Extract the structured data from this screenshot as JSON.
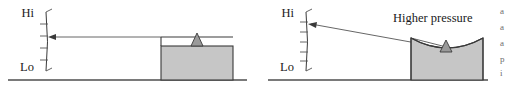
{
  "figure": {
    "panels": [
      {
        "id": "left-panel",
        "name": "low-pressure-panel",
        "gauge": {
          "name": "pressure-gauge-left",
          "high_label": "Hi",
          "low_label": "Lo",
          "tick_count": 5,
          "needle_reading_fraction": 0.5
        },
        "vessel": {
          "name": "vessel-left",
          "surface": "flat",
          "fill_color": "#c6c6c6",
          "outline_color": "#3a3a3a"
        },
        "callout": {
          "text": "",
          "visible": false
        }
      },
      {
        "id": "right-panel",
        "name": "high-pressure-panel",
        "gauge": {
          "name": "pressure-gauge-right",
          "high_label": "Hi",
          "low_label": "Lo",
          "tick_count": 6,
          "needle_reading_fraction": 0.78
        },
        "vessel": {
          "name": "vessel-right",
          "surface": "concave",
          "fill_color": "#c6c6c6",
          "outline_color": "#3a3a3a"
        },
        "callout": {
          "text": "Higher pressure",
          "visible": true
        }
      }
    ],
    "margin_text": {
      "name": "cropped-body-text",
      "lines": [
        "a",
        "a",
        "a",
        "p",
        "i"
      ]
    },
    "colors": {
      "vessel_fill": "#c6c6c6",
      "outline": "#3a3a3a",
      "ground": "#7a7a7a",
      "pointer": "#9a9a9a",
      "text": "#1b1b1b"
    }
  }
}
